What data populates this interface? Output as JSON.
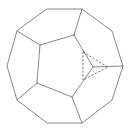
{
  "diagram": {
    "type": "polyhedron-truncation",
    "colors": {
      "edge": "#7a7a7a",
      "hidden_edge": "#6a6a6a",
      "background": "#ffffff"
    },
    "outer_outline": [
      [
        47,
        9
      ],
      [
        82,
        9
      ],
      [
        112,
        31
      ],
      [
        123,
        66
      ],
      [
        112,
        100
      ],
      [
        82,
        123
      ],
      [
        47,
        123
      ],
      [
        17,
        100
      ],
      [
        7,
        66
      ],
      [
        17,
        31
      ]
    ],
    "inner_edges": [
      [
        [
          40,
          45
        ],
        [
          74,
          35
        ]
      ],
      [
        [
          74,
          35
        ],
        [
          93,
          67
        ]
      ],
      [
        [
          93,
          67
        ],
        [
          72,
          97
        ]
      ],
      [
        [
          72,
          97
        ],
        [
          37,
          83
        ]
      ],
      [
        [
          37,
          83
        ],
        [
          40,
          45
        ]
      ],
      [
        [
          93,
          67
        ],
        [
          123,
          66
        ]
      ],
      [
        [
          74,
          35
        ],
        [
          82,
          9
        ]
      ],
      [
        [
          40,
          45
        ],
        [
          17,
          31
        ]
      ],
      [
        [
          37,
          83
        ],
        [
          17,
          100
        ]
      ],
      [
        [
          72,
          97
        ],
        [
          82,
          123
        ]
      ]
    ],
    "dashed_triangle": [
      [
        83,
        52
      ],
      [
        108,
        67
      ],
      [
        83,
        80
      ]
    ]
  }
}
